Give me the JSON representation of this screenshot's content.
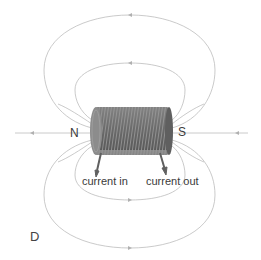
{
  "figure": {
    "caption": "D",
    "poles": {
      "north": "N",
      "south": "S"
    },
    "leads": {
      "in": "current in",
      "out": "current out"
    },
    "colors": {
      "field_line": "#b5b5b5",
      "coil": "#7a7a7a",
      "coil_dark": "#5c5c5c",
      "text": "#3a3a3a"
    }
  }
}
